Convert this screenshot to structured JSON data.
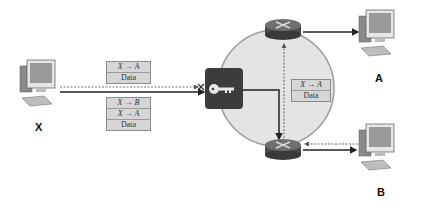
{
  "nodes": {
    "x": {
      "label": "X"
    },
    "a": {
      "label": "A"
    },
    "b": {
      "label": "B"
    }
  },
  "packets": {
    "left_top": {
      "rows": [
        "X → A",
        "Data"
      ]
    },
    "left_bottom": {
      "rows": [
        "X → B",
        "X → A",
        "Data"
      ]
    },
    "inner": {
      "rows": [
        "X → A",
        "Data"
      ]
    }
  },
  "icons": {
    "gateway": "key-icon",
    "blocked": "cross-icon"
  },
  "colors": {
    "network_circle": "#e4e4e4",
    "circle_border": "#9a9a9a",
    "router_body": "#4a4a4a",
    "gateway_box": "#3c3c3c",
    "packet_bg": "#d6d6d6"
  }
}
